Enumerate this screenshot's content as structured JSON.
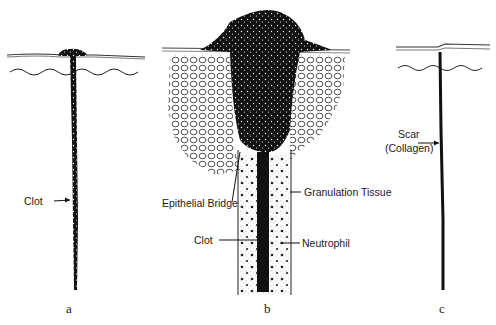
{
  "figure": {
    "panels": [
      {
        "id": "a",
        "caption": "a",
        "labels": [
          "Clot"
        ]
      },
      {
        "id": "b",
        "caption": "b",
        "labels": [
          "Epithelial Bridge",
          "Granulation Tissue",
          "Clot",
          "Neutrophil"
        ]
      },
      {
        "id": "c",
        "caption": "c",
        "labels": [
          "Scar",
          "(Collagen)"
        ]
      }
    ]
  },
  "labels": {
    "a_clot": "Clot",
    "b_epithelial_bridge": "Epithelial Bridge",
    "b_granulation_tissue": "Granulation Tissue",
    "b_clot": "Clot",
    "b_neutrophil": "Neutrophil",
    "c_scar": "Scar",
    "c_collagen": "(Collagen)"
  },
  "captions": {
    "a": "a",
    "b": "b",
    "c": "c"
  },
  "colors": {
    "ink": "#1a1a1a",
    "background": "#ffffff"
  }
}
